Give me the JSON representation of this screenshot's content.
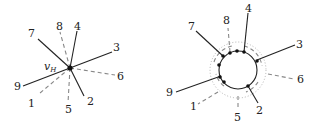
{
  "left_diagram": {
    "vertex_label": "v",
    "vertex_subscript": "H",
    "labels": [
      "1",
      "2",
      "3",
      "4",
      "5",
      "6",
      "7",
      "8",
      "9"
    ]
  },
  "right_diagram": {
    "labels": [
      "1",
      "2",
      "3",
      "4",
      "5",
      "6",
      "7",
      "8",
      "9"
    ]
  }
}
